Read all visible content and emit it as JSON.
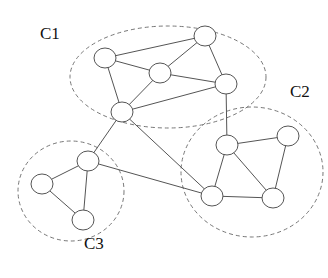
{
  "diagram": {
    "type": "community-graph",
    "clusters": [
      {
        "id": "C1",
        "label": "C1",
        "cx": 168,
        "cy": 77,
        "rx": 98,
        "ry": 51,
        "label_x": 40,
        "label_y": 38
      },
      {
        "id": "C2",
        "label": "C2",
        "cx": 252,
        "cy": 172,
        "rx": 71,
        "ry": 65,
        "label_x": 290,
        "label_y": 96
      },
      {
        "id": "C3",
        "label": "C3",
        "cx": 71,
        "cy": 191,
        "rx": 53,
        "ry": 50,
        "label_x": 84,
        "label_y": 248
      }
    ],
    "nodes": [
      {
        "id": "a",
        "cluster": "C1",
        "x": 105,
        "y": 58
      },
      {
        "id": "b",
        "cluster": "C1",
        "x": 205,
        "y": 36
      },
      {
        "id": "c",
        "cluster": "C1",
        "x": 160,
        "y": 73
      },
      {
        "id": "d",
        "cluster": "C1",
        "x": 226,
        "y": 84
      },
      {
        "id": "e",
        "cluster": "C1",
        "x": 122,
        "y": 112
      },
      {
        "id": "f",
        "cluster": "C2",
        "x": 227,
        "y": 145
      },
      {
        "id": "g",
        "cluster": "C2",
        "x": 288,
        "y": 136
      },
      {
        "id": "h",
        "cluster": "C2",
        "x": 212,
        "y": 196
      },
      {
        "id": "i",
        "cluster": "C2",
        "x": 273,
        "y": 198
      },
      {
        "id": "j",
        "cluster": "C3",
        "x": 88,
        "y": 161
      },
      {
        "id": "k",
        "cluster": "C3",
        "x": 42,
        "y": 184
      },
      {
        "id": "l",
        "cluster": "C3",
        "x": 83,
        "y": 220
      }
    ],
    "edges": [
      [
        "a",
        "b"
      ],
      [
        "a",
        "c"
      ],
      [
        "a",
        "e"
      ],
      [
        "b",
        "c"
      ],
      [
        "b",
        "d"
      ],
      [
        "c",
        "d"
      ],
      [
        "c",
        "e"
      ],
      [
        "e",
        "d"
      ],
      [
        "d",
        "f"
      ],
      [
        "f",
        "g"
      ],
      [
        "f",
        "h"
      ],
      [
        "f",
        "i"
      ],
      [
        "g",
        "i"
      ],
      [
        "h",
        "i"
      ],
      [
        "e",
        "j"
      ],
      [
        "e",
        "h"
      ],
      [
        "j",
        "h"
      ],
      [
        "j",
        "k"
      ],
      [
        "j",
        "l"
      ],
      [
        "k",
        "l"
      ]
    ],
    "node_radius_x": 11,
    "node_radius_y": 10,
    "colors": {
      "edge": "#555555",
      "node_stroke": "#555555",
      "node_fill": "#ffffff",
      "cluster_stroke": "#777777"
    }
  }
}
